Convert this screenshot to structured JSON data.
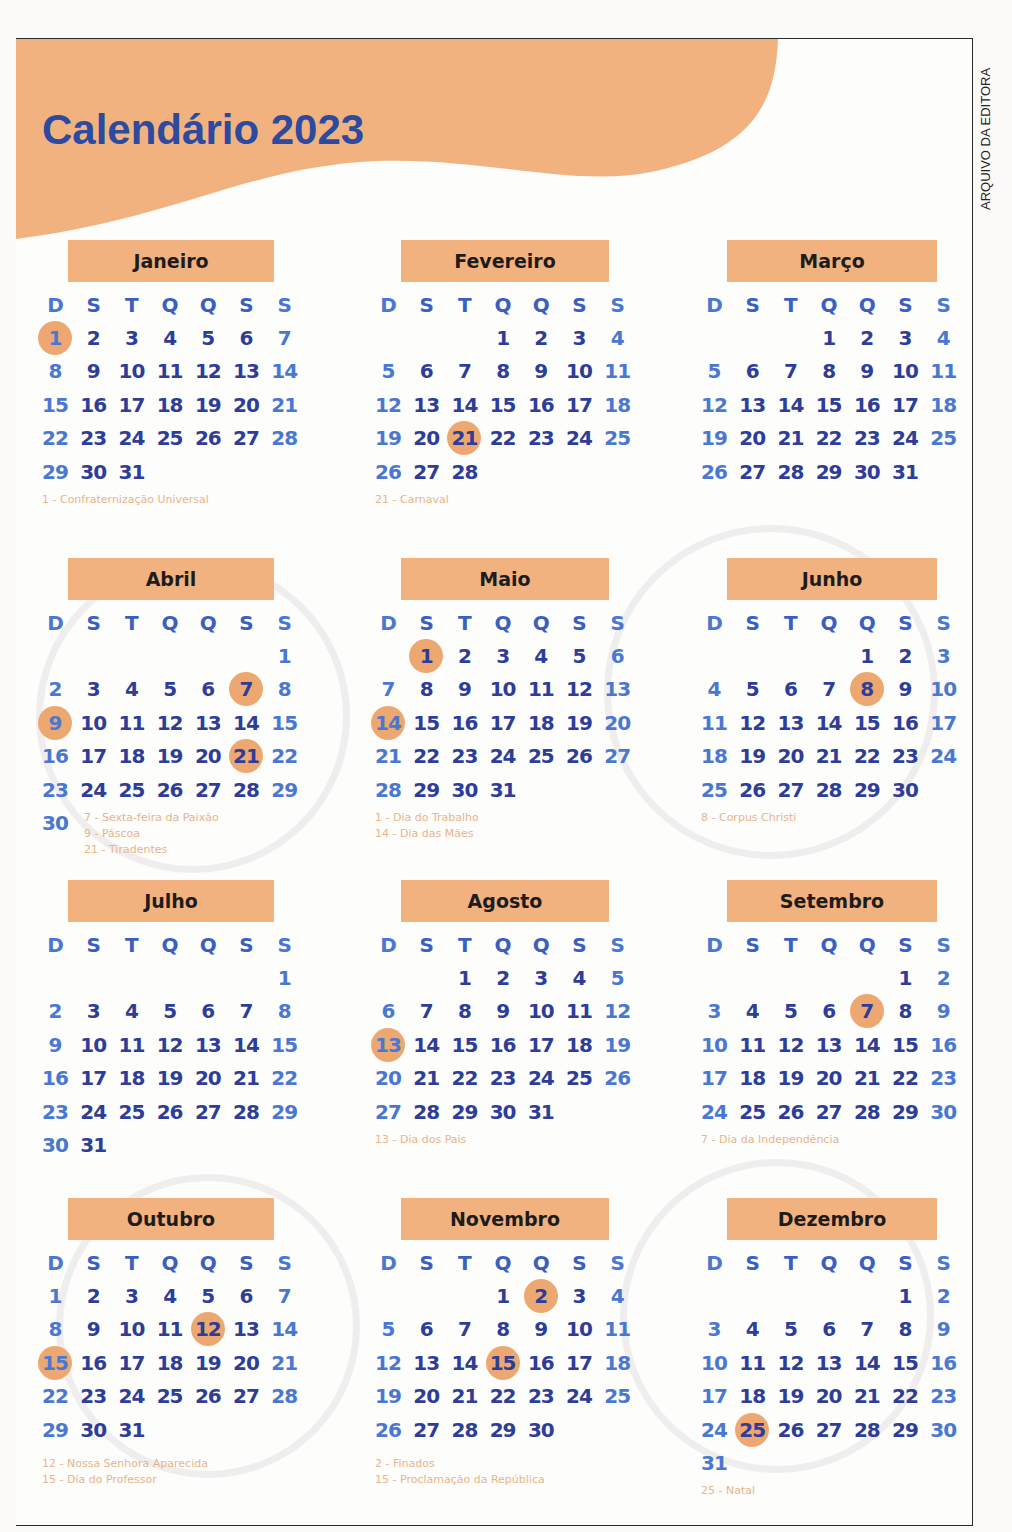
{
  "header": {
    "title": "Calendário 2023",
    "credit": "ARQUIVO DA EDITORA"
  },
  "colors": {
    "accent_orange": "#f2b27f",
    "holiday_circle": "#eda871",
    "day_number_blue": "#2e3d97",
    "title_blue": "#2b4aa0",
    "note_text": "#e9b48a"
  },
  "weekdays": [
    "D",
    "S",
    "T",
    "Q",
    "Q",
    "S",
    "S"
  ],
  "months": [
    {
      "name": "Janeiro",
      "start": 0,
      "days": 31,
      "holidays": [
        1
      ],
      "notes": [
        "1 - Confraternização Universal"
      ]
    },
    {
      "name": "Fevereiro",
      "start": 3,
      "days": 28,
      "holidays": [
        21
      ],
      "notes": [
        "21 - Carnaval"
      ]
    },
    {
      "name": "Março",
      "start": 3,
      "days": 31,
      "holidays": [],
      "notes": []
    },
    {
      "name": "Abril",
      "start": 6,
      "days": 30,
      "holidays": [
        7,
        9,
        21
      ],
      "notes": [
        "7 - Sexta-feira da Paixão",
        "9 - Páscoa",
        "21 - Tiradentes"
      ]
    },
    {
      "name": "Maio",
      "start": 1,
      "days": 31,
      "holidays": [
        1,
        14
      ],
      "notes": [
        "1 - Dia do Trabalho",
        "14 - Dia das Mães"
      ]
    },
    {
      "name": "Junho",
      "start": 4,
      "days": 30,
      "holidays": [
        8
      ],
      "notes": [
        "8 - Corpus Christi"
      ]
    },
    {
      "name": "Julho",
      "start": 6,
      "days": 31,
      "holidays": [],
      "notes": []
    },
    {
      "name": "Agosto",
      "start": 2,
      "days": 31,
      "holidays": [
        13
      ],
      "notes": [
        "13 - Dia dos Pais"
      ]
    },
    {
      "name": "Setembro",
      "start": 5,
      "days": 30,
      "holidays": [
        7
      ],
      "notes": [
        "7 - Dia da Independência"
      ]
    },
    {
      "name": "Outubro",
      "start": 0,
      "days": 31,
      "holidays": [
        12,
        15
      ],
      "notes": [
        "12 - Nossa Senhora Aparecida",
        "15 - Dia do Professor"
      ]
    },
    {
      "name": "Novembro",
      "start": 3,
      "days": 30,
      "holidays": [
        2,
        15
      ],
      "notes": [
        "2 - Finados",
        "15 - Proclamação da República"
      ]
    },
    {
      "name": "Dezembro",
      "start": 5,
      "days": 31,
      "holidays": [
        25
      ],
      "notes": [
        "25 - Natal"
      ]
    }
  ]
}
